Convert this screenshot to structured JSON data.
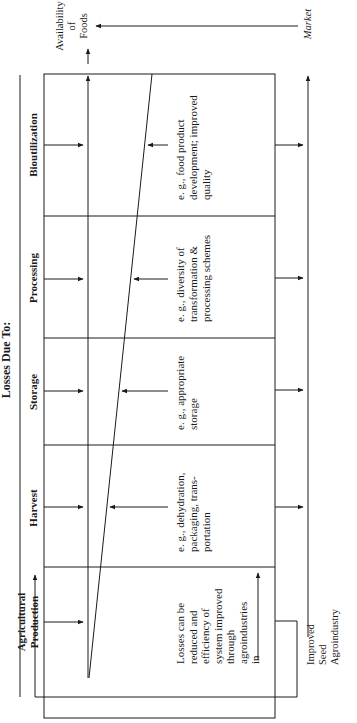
{
  "header": {
    "title": "Losses Due To:"
  },
  "stages": [
    {
      "label": "Agricultural",
      "label2": "Production",
      "example": [
        "Losses can be",
        "reduced and",
        "efficiency of",
        "system improved",
        "through",
        "agroindustries",
        "in"
      ]
    },
    {
      "label": "Harvest",
      "example": [
        "e. g., dehydration,",
        "packaging, trans-",
        "portation"
      ]
    },
    {
      "label": "Storage",
      "example": [
        "e. g., appropriate",
        "storage"
      ]
    },
    {
      "label": "Processing",
      "example": [
        "e. g., diversity of",
        "transformation &",
        "processing schemes"
      ]
    },
    {
      "label": "Bioutilization",
      "example": [
        "e. g., food product",
        "development; improved",
        "quality"
      ]
    }
  ],
  "outputs": {
    "availability": [
      "Availability",
      "of",
      "Foods"
    ],
    "market": "Market"
  },
  "feedback": {
    "lines": [
      "Improved",
      "Seed",
      "Agroindustry"
    ]
  },
  "colors": {
    "ink": "#1a1a1a",
    "background": "#ffffff"
  }
}
